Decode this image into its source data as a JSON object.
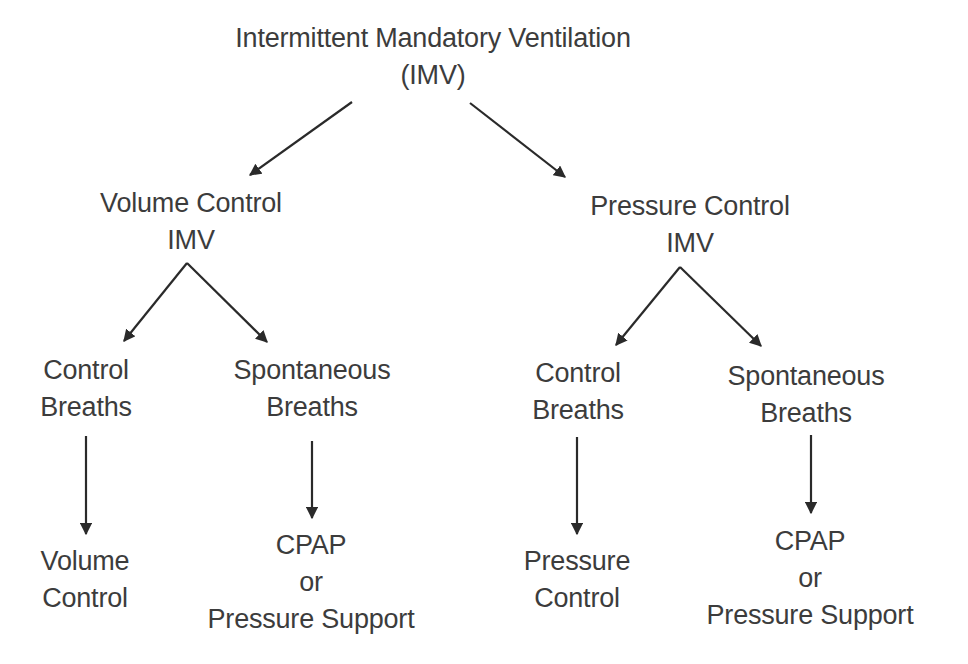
{
  "diagram": {
    "type": "tree",
    "colors": {
      "text": "#3c3c3c",
      "arrow": "#2a2a2a",
      "background": "#ffffff"
    },
    "nodes": {
      "root": {
        "line1": "Intermittent Mandatory Ventilation",
        "line2": "(IMV)"
      },
      "vc_imv": {
        "line1": "Volume Control",
        "line2": "IMV"
      },
      "pc_imv": {
        "line1": "Pressure Control",
        "line2": "IMV"
      },
      "vc_control": {
        "line1": "Control",
        "line2": "Breaths"
      },
      "vc_spont": {
        "line1": "Spontaneous",
        "line2": "Breaths"
      },
      "pc_control": {
        "line1": "Control",
        "line2": "Breaths"
      },
      "pc_spont": {
        "line1": "Spontaneous",
        "line2": "Breaths"
      },
      "vc_leaf": {
        "line1": "Volume",
        "line2": "Control"
      },
      "vc_spont_leaf": {
        "line1": "CPAP",
        "line2": "or",
        "line3": "Pressure Support"
      },
      "pc_leaf": {
        "line1": "Pressure",
        "line2": "Control"
      },
      "pc_spont_leaf": {
        "line1": "CPAP",
        "line2": "or",
        "line3": "Pressure Support"
      }
    },
    "edges": [
      {
        "from": "root",
        "to": "vc_imv"
      },
      {
        "from": "root",
        "to": "pc_imv"
      },
      {
        "from": "vc_imv",
        "to": "vc_control"
      },
      {
        "from": "vc_imv",
        "to": "vc_spont"
      },
      {
        "from": "pc_imv",
        "to": "pc_control"
      },
      {
        "from": "pc_imv",
        "to": "pc_spont"
      },
      {
        "from": "vc_control",
        "to": "vc_leaf"
      },
      {
        "from": "vc_spont",
        "to": "vc_spont_leaf"
      },
      {
        "from": "pc_control",
        "to": "pc_leaf"
      },
      {
        "from": "pc_spont",
        "to": "pc_spont_leaf"
      }
    ]
  }
}
